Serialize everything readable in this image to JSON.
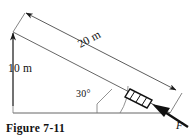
{
  "figure": {
    "caption": "Figure 7-11",
    "background_color": "#ffffff",
    "line_color": "#333333",
    "bold_line_color": "#111111",
    "labels": {
      "height": "10 m",
      "length": "20 m",
      "angle": "30°",
      "force": "F"
    },
    "geometry": {
      "apex": "13,32",
      "base_left": "13,113",
      "base_right": "170,113",
      "incline_start": "13,32",
      "incline_end": "170,113"
    },
    "elements": {
      "vertical_dimension_name": "10 m vertical height arrow",
      "incline_dimension_name": "20 m incline length dimension",
      "angle_arc_name": "30 degree angle arc",
      "block_name": "hatched block on incline",
      "force_arrow_name": "applied force F arrow"
    }
  }
}
